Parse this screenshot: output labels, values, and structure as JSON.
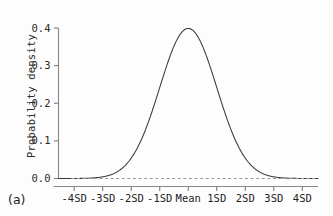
{
  "figure": {
    "panel_label": "(a)",
    "ylabel": "Probability density"
  },
  "chart_data": {
    "type": "line",
    "title": "",
    "subtitle": "",
    "xlabel": "",
    "ylabel": "Probability density",
    "panel": "(a)",
    "grid": false,
    "legend": null,
    "xlim": [
      -4.55,
      4.55
    ],
    "ylim": [
      0.0,
      0.42
    ],
    "x_tick_labels": [
      "-4SD",
      "-3SD",
      "-2SD",
      "-1SD",
      "Mean",
      "1SD",
      "2SD",
      "3SD",
      "4SD"
    ],
    "x_tick_values": [
      -4,
      -3,
      -2,
      -1,
      0,
      1,
      2,
      3,
      4
    ],
    "y_tick_labels": [
      "0.0",
      "0.1",
      "0.2",
      "0.3",
      "0.4"
    ],
    "y_tick_values": [
      0.0,
      0.1,
      0.2,
      0.3,
      0.4
    ],
    "series": [
      {
        "name": "normal-density",
        "style": "solid",
        "color": "#3a3a3a",
        "x": [
          -4.5,
          -4.25,
          -4,
          -3.75,
          -3.5,
          -3.25,
          -3,
          -2.75,
          -2.5,
          -2.25,
          -2,
          -1.75,
          -1.5,
          -1.25,
          -1,
          -0.75,
          -0.5,
          -0.25,
          0,
          0.25,
          0.5,
          0.75,
          1,
          1.25,
          1.5,
          1.75,
          2,
          2.25,
          2.5,
          2.75,
          3,
          3.25,
          3.5,
          3.75,
          4,
          4.25,
          4.5
        ],
        "y": [
          0.0,
          0.0001,
          0.0001,
          0.0003,
          0.0009,
          0.002,
          0.0044,
          0.0091,
          0.0175,
          0.0317,
          0.054,
          0.0863,
          0.1295,
          0.1826,
          0.242,
          0.3011,
          0.3521,
          0.3867,
          0.3989,
          0.3867,
          0.3521,
          0.3011,
          0.242,
          0.1826,
          0.1295,
          0.0863,
          0.054,
          0.0317,
          0.0175,
          0.0091,
          0.0044,
          0.002,
          0.0009,
          0.0003,
          0.0001,
          0.0001,
          0.0
        ]
      },
      {
        "name": "zero-baseline",
        "style": "dashed",
        "color": "#9a9a9a",
        "x": [
          -4.1,
          4.45
        ],
        "y": [
          0.0,
          0.0
        ]
      }
    ],
    "peak": {
      "x": 0,
      "y": 0.3989,
      "label": "Mean"
    }
  }
}
